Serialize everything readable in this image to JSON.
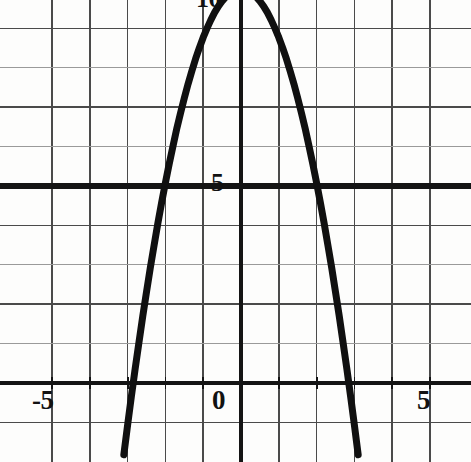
{
  "figure": {
    "name": "parabola-graph",
    "background_color": "#fdfdfc",
    "width": 471,
    "height": 462
  },
  "axis_labels": {
    "x_neg5": "-5",
    "x_zero": "0",
    "x_pos5": "5",
    "y_five": "5",
    "y_ten": "10"
  },
  "style": {
    "curve_color": "#101010",
    "axis_color": "#141414",
    "grid_major_color": "#4a4a4a",
    "grid_minor_color": "#9a9a9a"
  },
  "chart_data": {
    "type": "line",
    "title": "",
    "xlabel": "",
    "ylabel": "",
    "xlim": [
      -5.9,
      5.9
    ],
    "ylim": [
      -1.8,
      10.9
    ],
    "grid": true,
    "legend": "none",
    "xticks": [
      -5,
      0,
      5
    ],
    "xtick_labels": [
      "-5",
      "0",
      "5"
    ],
    "yticks": [
      5,
      10
    ],
    "ytick_labels": [
      "5",
      "10"
    ],
    "x_gridlines": [
      -5,
      -4,
      -3,
      -2,
      -1,
      0,
      1,
      2,
      3,
      4,
      5
    ],
    "y_gridlines": [
      -1,
      0,
      1,
      2,
      3,
      4,
      5,
      6,
      7,
      8,
      9,
      10
    ],
    "annotations": [
      {
        "kind": "vertex",
        "x": 0,
        "y": 10
      },
      {
        "kind": "root",
        "x": -2.85,
        "y": 0
      },
      {
        "kind": "root",
        "x": 2.85,
        "y": 0
      },
      {
        "kind": "y-equals-5-crossing",
        "x": -1.95,
        "y": 5
      },
      {
        "kind": "y-equals-5-crossing",
        "x": 1.95,
        "y": 5
      }
    ],
    "series": [
      {
        "name": "parabola",
        "equation": "y = 10 - 1.23x^2",
        "color": "#101010",
        "linewidth": 7,
        "x": [
          -3.1,
          -3.0,
          -2.9,
          -2.8,
          -2.7,
          -2.6,
          -2.5,
          -2.4,
          -2.3,
          -2.2,
          -2.1,
          -2.0,
          -1.9,
          -1.8,
          -1.7,
          -1.6,
          -1.5,
          -1.4,
          -1.3,
          -1.2,
          -1.1,
          -1.0,
          -0.9,
          -0.8,
          -0.7,
          -0.6,
          -0.5,
          -0.4,
          -0.3,
          -0.2,
          -0.1,
          0.0,
          0.1,
          0.2,
          0.3,
          0.4,
          0.5,
          0.6,
          0.7,
          0.8,
          0.9,
          1.0,
          1.1,
          1.2,
          1.3,
          1.4,
          1.5,
          1.6,
          1.7,
          1.8,
          1.9,
          2.0,
          2.1,
          2.2,
          2.3,
          2.4,
          2.5,
          2.6,
          2.7,
          2.8,
          2.9,
          3.0,
          3.1
        ],
        "y": [
          -1.82,
          -1.07,
          -0.34,
          0.36,
          1.03,
          1.69,
          2.31,
          2.92,
          3.49,
          4.05,
          4.58,
          5.08,
          5.56,
          6.01,
          6.45,
          6.85,
          7.23,
          7.59,
          7.92,
          8.23,
          8.51,
          8.77,
          9.0,
          9.21,
          9.4,
          9.56,
          9.69,
          9.8,
          9.89,
          9.95,
          9.99,
          10.0,
          9.99,
          9.95,
          9.89,
          9.8,
          9.69,
          9.56,
          9.4,
          9.21,
          9.0,
          8.77,
          8.51,
          8.23,
          7.92,
          7.59,
          7.23,
          6.85,
          6.45,
          6.01,
          5.56,
          5.08,
          4.58,
          4.05,
          3.49,
          2.92,
          2.31,
          1.69,
          1.03,
          0.36,
          -0.34,
          -1.07,
          -1.82
        ]
      }
    ]
  }
}
